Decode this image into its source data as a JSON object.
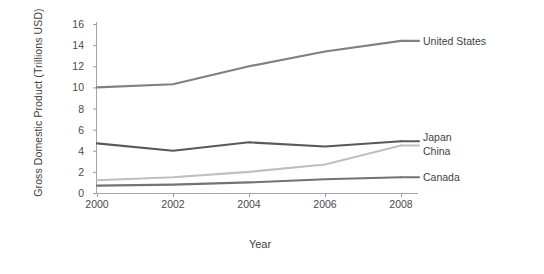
{
  "chart_data": {
    "type": "line",
    "title": "",
    "xlabel": "Year",
    "ylabel": "Gross Domestic Product (Trillions USD)",
    "x": [
      2000,
      2002,
      2004,
      2006,
      2008
    ],
    "xtick_labels": [
      "2000",
      "2002",
      "2004",
      "2006",
      "2008"
    ],
    "ytick_labels": [
      "0",
      "2",
      "4",
      "6",
      "8",
      "10",
      "12",
      "14",
      "16"
    ],
    "yticks": [
      0,
      2,
      4,
      6,
      8,
      10,
      12,
      14,
      16
    ],
    "ylim": [
      0,
      16
    ],
    "xlim": [
      2000,
      2008
    ],
    "grid": false,
    "legend_position": "right-of-lines",
    "series": [
      {
        "name": "United States",
        "color": "#808080",
        "values": [
          10.0,
          10.3,
          12.0,
          13.4,
          14.4
        ]
      },
      {
        "name": "Japan",
        "color": "#595959",
        "values": [
          4.7,
          4.0,
          4.8,
          4.4,
          4.9
        ]
      },
      {
        "name": "China",
        "color": "#bfbfbf",
        "values": [
          1.2,
          1.5,
          2.0,
          2.7,
          4.5
        ]
      },
      {
        "name": "Canada",
        "color": "#737373",
        "values": [
          0.7,
          0.8,
          1.0,
          1.3,
          1.5
        ]
      }
    ]
  },
  "axis": {
    "y_title": "Gross Domestic Product (Trillions USD)",
    "x_title": "Year"
  },
  "labels": {
    "united_states": "United States",
    "japan": "Japan",
    "china": "China",
    "canada": "Canada"
  },
  "colors": {
    "united_states": "#808080",
    "japan": "#595959",
    "china": "#bfbfbf",
    "canada": "#737373",
    "axis": "#9b9b9b",
    "text": "#3f3f3f",
    "background": "#ffffff"
  }
}
